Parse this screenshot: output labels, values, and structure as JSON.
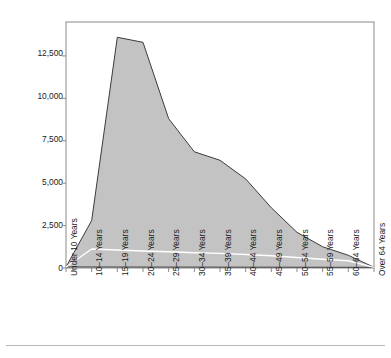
{
  "chart_data": {
    "type": "area",
    "title": "",
    "subtitle": "",
    "xlabel": "",
    "ylabel": "Part I and II Arrest Rates per 100,000 Persons in Each Age Group",
    "categories": [
      "Under 10 Years",
      "10–14 Years",
      "15–19 Years",
      "20–24 Years",
      "25–29 Years",
      "30–34 Years",
      "35–39 Years",
      "40–44 Years",
      "45–49 Years",
      "50–54 Years",
      "55–59 Years",
      "60–64 Years",
      "Over 64 Years"
    ],
    "ylim": [
      0,
      14500
    ],
    "xlim": [
      0,
      12
    ],
    "yticks": [
      0,
      2500,
      5000,
      7500,
      10000,
      12500
    ],
    "ytick_labels": [
      "0",
      "2,500",
      "5,000",
      "7,500",
      "10,000",
      "12,500"
    ],
    "grid": false,
    "legend": "none",
    "series": [
      {
        "name": "Total Part I and II Arrest Rate",
        "type": "area",
        "fill_color": "#c3c3c3",
        "line_color": "#3c3c3c",
        "values": [
          60,
          2800,
          13600,
          13300,
          8800,
          6850,
          6350,
          5250,
          3550,
          2100,
          1250,
          750,
          40
        ]
      },
      {
        "name": "Part I Violent Arrest Rate",
        "type": "line",
        "line_color": "#ffffff",
        "values": [
          60,
          1120,
          1060,
          1000,
          960,
          900,
          860,
          800,
          720,
          620,
          520,
          430,
          40
        ]
      }
    ],
    "annotations": []
  },
  "colors": {
    "fill": "#c3c3c3",
    "outline": "#3c3c3c",
    "overlay_line": "#ffffff",
    "axis": "#8a8a8a",
    "text": "#222222",
    "footer_rule": "#b9b9b9",
    "background": "#ffffff"
  }
}
